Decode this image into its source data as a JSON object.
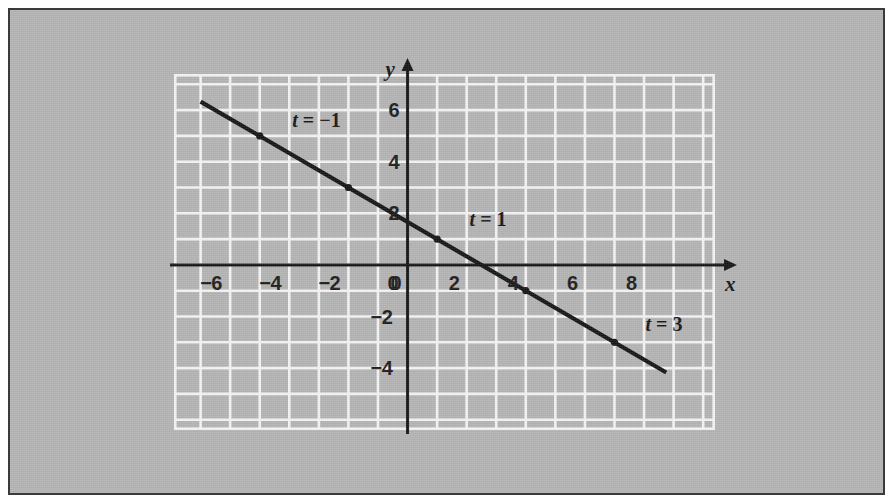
{
  "figure": {
    "background_color": "#b2b2b2",
    "frame_color": "#3a3a3a",
    "grid_color": "#f2f2f2",
    "ink_color": "#141414"
  },
  "axis_names": {
    "x": "x",
    "y": "y"
  },
  "chart_data": {
    "type": "line",
    "title": "",
    "subtitle": "",
    "xlabel": "x",
    "ylabel": "y",
    "grid": true,
    "legend": "none",
    "xlim": [
      -7.9,
      10.4
    ],
    "ylim": [
      -6.4,
      7.4
    ],
    "xticks": [
      -6,
      -4,
      -2,
      0,
      2,
      4,
      6,
      8
    ],
    "xtick_labels": [
      "−6",
      "−4",
      "−2",
      "0",
      "2",
      "4",
      "6",
      "8"
    ],
    "yticks": [
      6,
      4,
      2,
      -2,
      -4
    ],
    "ytick_labels": [
      "6",
      "4",
      "2",
      "−2",
      "−4"
    ],
    "grid_step": 1,
    "tick_step": 2,
    "series": [
      {
        "name": "parametric line",
        "equation": "y = -2/3 x + 5/3",
        "slope": -0.6667,
        "y_intercept": 1.6667,
        "x_start": -7.0,
        "y_start": 6.33,
        "x_end": 8.75,
        "y_end": -4.17,
        "points": [
          {
            "t": -1,
            "x": -5,
            "y": 5,
            "label": "t = −1",
            "show_label": true
          },
          {
            "t": 0,
            "x": -2,
            "y": 3,
            "label": "t = 0",
            "show_label": false
          },
          {
            "t": 1,
            "x": 1,
            "y": 1,
            "label": "t = 1",
            "show_label": true
          },
          {
            "t": 2,
            "x": 4,
            "y": -1,
            "label": "t = 2",
            "show_label": false
          },
          {
            "t": 3,
            "x": 7,
            "y": -3,
            "label": "t = 3",
            "show_label": true
          }
        ]
      }
    ],
    "annotations": [
      {
        "text": "t = −1",
        "var": "t",
        "rest": " = −1",
        "x": -3.9,
        "y": 5.55
      },
      {
        "text": "t = 1",
        "var": "t",
        "rest": " = 1",
        "x": 2.1,
        "y": 1.7
      },
      {
        "text": "t = 3",
        "var": "t",
        "rest": " = 3",
        "x": 8.05,
        "y": -2.35
      }
    ]
  }
}
